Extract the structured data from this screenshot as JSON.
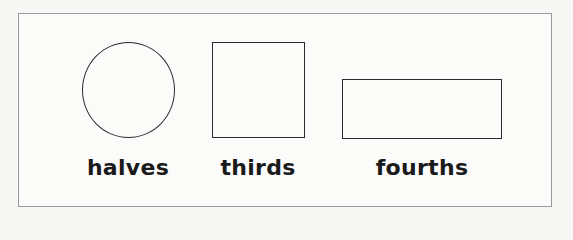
{
  "figure": {
    "shapes": [
      {
        "kind": "circle",
        "label": "halves"
      },
      {
        "kind": "square",
        "label": "thirds"
      },
      {
        "kind": "rectangle",
        "label": "fourths"
      }
    ],
    "colors": {
      "stroke": "#2a2a2a",
      "frame": "#9a9a9a",
      "text": "#1a1a1a"
    }
  }
}
